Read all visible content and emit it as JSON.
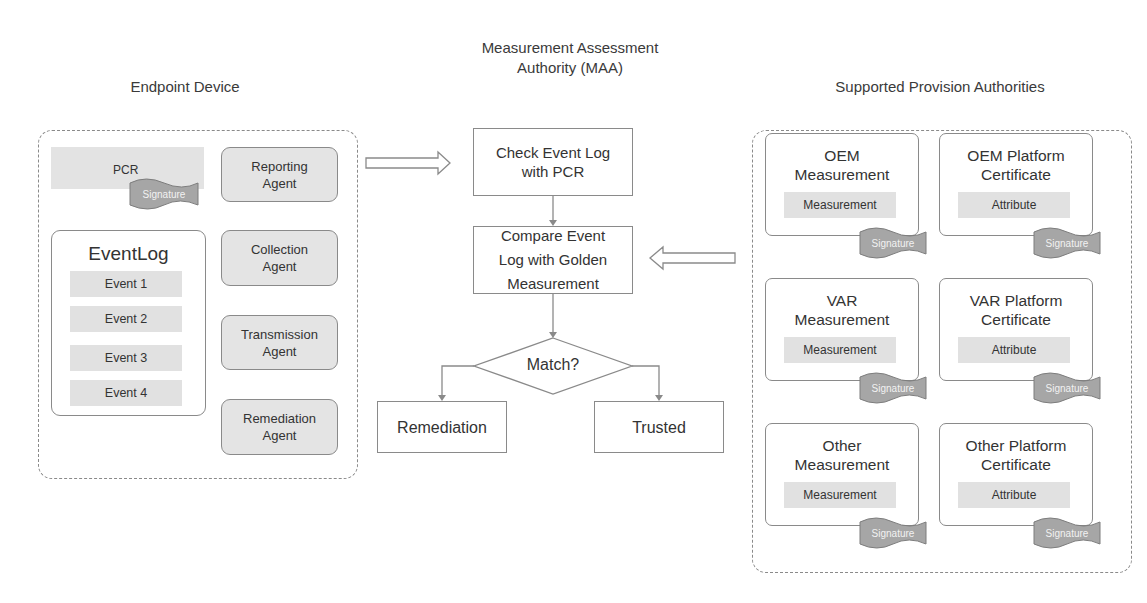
{
  "headings": {
    "endpoint": "Endpoint Device",
    "maa_line1": "Measurement Assessment",
    "maa_line2": "Authority (MAA)",
    "providers": "Supported Provision Authorities"
  },
  "endpoint": {
    "pcr": {
      "label": "PCR",
      "signature": "Signature"
    },
    "eventlog": {
      "title": "EventLog",
      "events": [
        "Event 1",
        "Event 2",
        "Event 3",
        "Event 4"
      ]
    },
    "agents": [
      {
        "line1": "Reporting",
        "line2": "Agent"
      },
      {
        "line1": "Collection",
        "line2": "Agent"
      },
      {
        "line1": "Transmission",
        "line2": "Agent"
      },
      {
        "line1": "Remediation",
        "line2": "Agent"
      }
    ]
  },
  "maa": {
    "check": {
      "line1": "Check Event Log",
      "line2": "with PCR"
    },
    "compare": {
      "line1": "Compare Event",
      "line2": "Log with Golden",
      "line3": "Measurement"
    },
    "decision": "Match?",
    "remediation": "Remediation",
    "trusted": "Trusted"
  },
  "providers": {
    "cards": [
      {
        "line1": "OEM",
        "line2": "Measurement",
        "inner": "Measurement",
        "signature": "Signature"
      },
      {
        "line1": "OEM Platform",
        "line2": "Certificate",
        "inner": "Attribute",
        "signature": "Signature"
      },
      {
        "line1": "VAR",
        "line2": "Measurement",
        "inner": "Measurement",
        "signature": "Signature"
      },
      {
        "line1": "VAR Platform",
        "line2": "Certificate",
        "inner": "Attribute",
        "signature": "Signature"
      },
      {
        "line1": "Other",
        "line2": "Measurement",
        "inner": "Measurement",
        "signature": "Signature"
      },
      {
        "line1": "Other Platform",
        "line2": "Certificate",
        "inner": "Attribute",
        "signature": "Signature"
      }
    ]
  },
  "colors": {
    "border": "#8a8a8a",
    "fill_gray": "#e2e2e2",
    "signature_fill": "#a6a6a6",
    "text": "#333333"
  }
}
